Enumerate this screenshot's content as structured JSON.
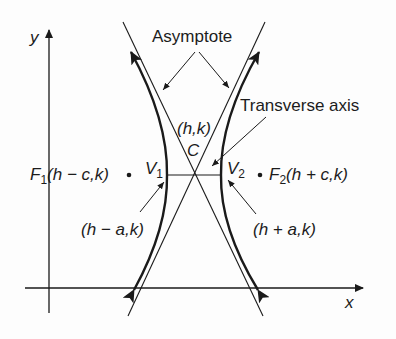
{
  "diagram": {
    "axes": {
      "x_label": "x",
      "y_label": "y"
    },
    "labels": {
      "asymptote": "Asymptote",
      "transverse_axis": "Transverse axis",
      "center_coords": "(h,k)",
      "center": "C",
      "v1": "V",
      "v1_sub": "1",
      "v2": "V",
      "v2_sub": "2",
      "f1": "F",
      "f1_sub": "1",
      "f1_coords": "(h − c,k)",
      "f2": "F",
      "f2_sub": "2",
      "f2_coords": "(h + c,k)",
      "v1_coords": "(h − a,k)",
      "v2_coords": "(h + a,k)"
    },
    "colors": {
      "stroke": "#1a1a1a",
      "background": "#fdfdfd"
    }
  }
}
